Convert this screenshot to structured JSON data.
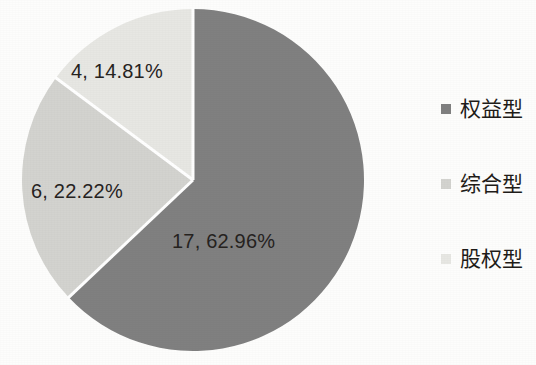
{
  "chart_data": {
    "type": "pie",
    "title": "",
    "subtitle": "",
    "xlabel": "",
    "ylabel": "",
    "total": 27,
    "grid": false,
    "legend_position": "right",
    "label_format": "{value}, {percent}",
    "categories": [
      "权益型",
      "综合型",
      "股权型"
    ],
    "values": [
      17,
      6,
      4
    ],
    "percents": [
      62.96,
      22.22,
      14.81
    ],
    "colors": [
      "#808080",
      "#d3d3cf",
      "#e7e7e3"
    ],
    "slices": [
      {
        "name": "权益型",
        "value": 17,
        "percent": 62.96,
        "label": "17, 62.96%",
        "color": "#808080",
        "start_angle": 0,
        "sweep_angle": 226.66
      },
      {
        "name": "综合型",
        "value": 6,
        "percent": 22.22,
        "label": "6, 22.22%",
        "color": "#d3d3cf",
        "start_angle": 226.66,
        "sweep_angle": 80.0
      },
      {
        "name": "股权型",
        "value": 4,
        "percent": 14.81,
        "label": "4, 14.81%",
        "color": "#e7e7e3",
        "start_angle": 306.66,
        "sweep_angle": 53.34
      }
    ],
    "geometry": {
      "center_x": 193,
      "center_y": 180,
      "radius": 171,
      "separator_color": "#ffffff",
      "separator_width": 3
    }
  },
  "legend": {
    "items": [
      {
        "label": "权益型",
        "color": "#808080"
      },
      {
        "label": "综合型",
        "color": "#d3d3cf"
      },
      {
        "label": "股权型",
        "color": "#e7e7e3"
      }
    ]
  },
  "canvas": {
    "background": "#fdfdfc",
    "text_color": "#26231f"
  }
}
